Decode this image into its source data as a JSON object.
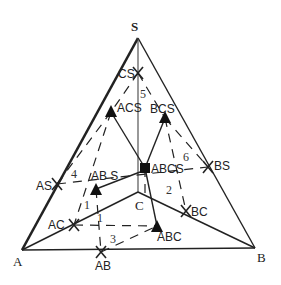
{
  "diagram": {
    "type": "quaternary phase diagram projection",
    "vertices": {
      "S": {
        "label": "S",
        "x": 138,
        "y": 38
      },
      "A": {
        "label": "A",
        "x": 22,
        "y": 250
      },
      "B": {
        "label": "B",
        "x": 255,
        "y": 248
      }
    },
    "points": {
      "CS": {
        "label": "CS",
        "x": 138,
        "y": 73,
        "marker": "cross"
      },
      "ACS": {
        "label": "ACS",
        "x": 111,
        "y": 112,
        "marker": "triangle"
      },
      "BCS": {
        "label": "BCS",
        "x": 165,
        "y": 118,
        "marker": "triangle"
      },
      "ABCS": {
        "label": "ABCS",
        "x": 145,
        "y": 168,
        "marker": "square"
      },
      "C": {
        "label": "C",
        "x": 139,
        "y": 192,
        "marker": "none"
      },
      "AS": {
        "label": "AS",
        "x": 57,
        "y": 184,
        "marker": "cross"
      },
      "ABS": {
        "label": "AB S",
        "x": 96,
        "y": 189,
        "marker": "triangle"
      },
      "BS": {
        "label": "BS",
        "x": 208,
        "y": 167,
        "marker": "cross"
      },
      "AC": {
        "label": "AC",
        "x": 74,
        "y": 225,
        "marker": "cross"
      },
      "ABC": {
        "label": "ABC",
        "x": 157,
        "y": 226,
        "marker": "triangle"
      },
      "BC": {
        "label": "BC",
        "x": 186,
        "y": 211,
        "marker": "cross"
      },
      "AB": {
        "label": "AB",
        "x": 101,
        "y": 252,
        "marker": "cross"
      }
    },
    "region_numbers": [
      "1",
      "1",
      "2",
      "3",
      "4",
      "5",
      "6"
    ],
    "colors": {
      "line": "#222222",
      "background": "#ffffff"
    }
  }
}
